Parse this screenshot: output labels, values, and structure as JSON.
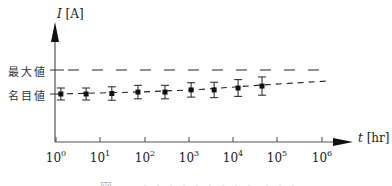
{
  "chart_data": {
    "type": "scatter",
    "title": "",
    "xlabel_var": "t",
    "xlabel_unit": "[hr]",
    "ylabel_var": "I",
    "ylabel_unit": "[A]",
    "x_scale": "log",
    "xlim_log10": [
      0,
      6
    ],
    "x_ticks": [
      "10^0",
      "10^1",
      "10^2",
      "10^3",
      "10^4",
      "10^5",
      "10^6"
    ],
    "x_tick_base": "10",
    "x_tick_exps": [
      "0",
      "1",
      "2",
      "3",
      "4",
      "5",
      "6"
    ],
    "y_tick_labels": [
      "最大値",
      "名目値"
    ],
    "reference_lines": [
      {
        "name": "最大値",
        "style": "dashed-long",
        "relative_level": 1.0
      },
      {
        "name": "名目値 trend",
        "style": "dashed-short",
        "note": "rising trend line from nominal value"
      }
    ],
    "grid": false,
    "legend": null,
    "series": [
      {
        "name": "measured current",
        "marker": "square",
        "error_bars": true,
        "points": [
          {
            "log10_t": 0.11,
            "y_rel": 0.0,
            "err": 0.25
          },
          {
            "log10_t": 0.68,
            "y_rel": 0.0,
            "err": 0.25
          },
          {
            "log10_t": 1.26,
            "y_rel": 0.02,
            "err": 0.28
          },
          {
            "log10_t": 1.85,
            "y_rel": 0.08,
            "err": 0.28
          },
          {
            "log10_t": 2.46,
            "y_rel": 0.08,
            "err": 0.28
          },
          {
            "log10_t": 3.05,
            "y_rel": 0.17,
            "err": 0.3
          },
          {
            "log10_t": 3.57,
            "y_rel": 0.17,
            "err": 0.32
          },
          {
            "log10_t": 4.11,
            "y_rel": 0.25,
            "err": 0.35
          },
          {
            "log10_t": 4.65,
            "y_rel": 0.33,
            "err": 0.38
          }
        ]
      }
    ],
    "note": "y values relative: 0 = 名目値 (nominal), 1 = 最大値 (maximum)"
  },
  "labels": {
    "y_var": "I",
    "y_unit": " [A]",
    "x_var": "t",
    "x_unit": " [hr]",
    "max_value": "最大値",
    "nominal_value": "名目値",
    "caption": "図 ━━ ・・・・・・・・・ ・・・"
  },
  "ticks": [
    {
      "base": "10",
      "exp": "0"
    },
    {
      "base": "10",
      "exp": "1"
    },
    {
      "base": "10",
      "exp": "2"
    },
    {
      "base": "10",
      "exp": "3"
    },
    {
      "base": "10",
      "exp": "4"
    },
    {
      "base": "10",
      "exp": "5"
    },
    {
      "base": "10",
      "exp": "6"
    }
  ]
}
